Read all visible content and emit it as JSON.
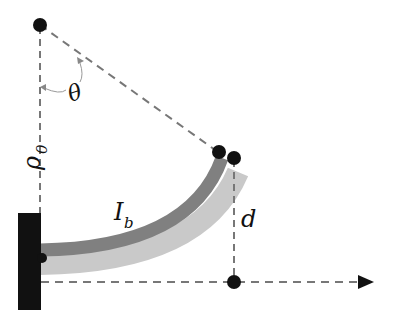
{
  "diagram": {
    "labels": {
      "angle": "θ",
      "radius": "ρ",
      "radius_sub": "0",
      "current": "I",
      "current_sub": "b",
      "deflection": "d"
    },
    "colors": {
      "beam_dark": "#7f7f7f",
      "beam_light": "#c8c8c8",
      "dashes": "#777777",
      "points": "#111111",
      "wall": "#111111"
    }
  }
}
